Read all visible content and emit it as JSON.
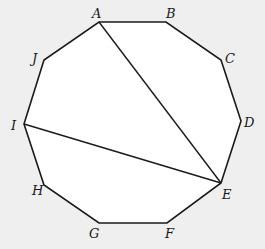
{
  "diagram": {
    "shape": "regular decagon",
    "colors": {
      "background": "#efefef",
      "fill": "#ffffff",
      "stroke": "#1a1a1a"
    },
    "vertices": [
      {
        "name": "A",
        "x": 99,
        "y": 22,
        "lx": 92,
        "ly": 18
      },
      {
        "name": "B",
        "x": 166,
        "y": 22,
        "lx": 166,
        "ly": 18
      },
      {
        "name": "C",
        "x": 221,
        "y": 60,
        "lx": 225,
        "ly": 63
      },
      {
        "name": "D",
        "x": 241,
        "y": 121,
        "lx": 244,
        "ly": 127
      },
      {
        "name": "E",
        "x": 221,
        "y": 183,
        "lx": 222,
        "ly": 199
      },
      {
        "name": "F",
        "x": 167,
        "y": 223,
        "lx": 165,
        "ly": 238
      },
      {
        "name": "G",
        "x": 99,
        "y": 223,
        "lx": 89,
        "ly": 238
      },
      {
        "name": "H",
        "x": 44,
        "y": 185,
        "lx": 32,
        "ly": 195
      },
      {
        "name": "I",
        "x": 24,
        "y": 124,
        "lx": 11,
        "ly": 130
      },
      {
        "name": "J",
        "x": 44,
        "y": 60,
        "lx": 32,
        "ly": 63
      }
    ],
    "diagonals": [
      {
        "from": "A",
        "to": "E"
      },
      {
        "from": "I",
        "to": "E"
      }
    ]
  }
}
